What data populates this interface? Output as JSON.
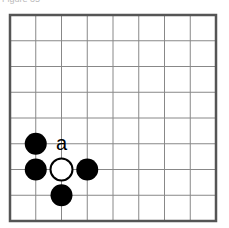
{
  "caption": "Figure 35",
  "board": {
    "columns": 8,
    "rows": 8,
    "origin_x": 10,
    "origin_y": 15,
    "cell": 25.75,
    "line_color": "#888888",
    "border_color": "#555555"
  },
  "stones": [
    {
      "color": "black",
      "col": 1,
      "row": 5
    },
    {
      "color": "black",
      "col": 1,
      "row": 6
    },
    {
      "color": "white",
      "col": 2,
      "row": 6
    },
    {
      "color": "black",
      "col": 3,
      "row": 6
    },
    {
      "color": "black",
      "col": 2,
      "row": 7
    }
  ],
  "labels": [
    {
      "text": "a",
      "col": 2,
      "row": 5
    }
  ]
}
